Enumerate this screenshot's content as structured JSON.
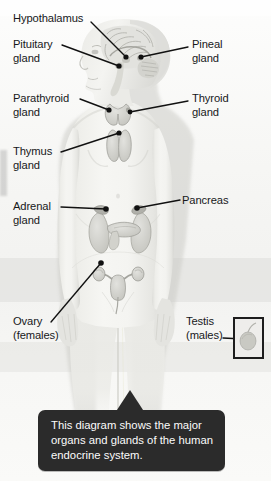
{
  "diagram": {
    "caption": "This diagram shows the major\norgans and glands of the human\nendocrine system.",
    "caption_box_color": "#2b2b2b",
    "caption_text_color": "#fbfbfb",
    "background_color": "#f7f7f5",
    "leader_line_color": "#111111",
    "label_text_color": "#17181a"
  },
  "labels": {
    "hypothalamus": "Hypothalamus",
    "pituitary": "Pituitary\ngland",
    "pineal": "Pineal\ngland",
    "parathyroid": "Parathyroid\ngland",
    "thyroid": "Thyroid\ngland",
    "thymus": "Thymus\ngland",
    "adrenal": "Adrenal\ngland",
    "pancreas": "Pancreas",
    "ovary": "Ovary\n(females)",
    "testis": "Testis\n(males)"
  },
  "organs": [
    {
      "name": "hypothalamus",
      "label": "Hypothalamus",
      "side": "left",
      "region": "brain"
    },
    {
      "name": "pituitary-gland",
      "label": "Pituitary gland",
      "side": "left",
      "region": "brain"
    },
    {
      "name": "pineal-gland",
      "label": "Pineal gland",
      "side": "right",
      "region": "brain"
    },
    {
      "name": "parathyroid-gland",
      "label": "Parathyroid gland",
      "side": "left",
      "region": "neck"
    },
    {
      "name": "thyroid-gland",
      "label": "Thyroid gland",
      "side": "right",
      "region": "neck"
    },
    {
      "name": "thymus-gland",
      "label": "Thymus gland",
      "side": "left",
      "region": "chest"
    },
    {
      "name": "adrenal-gland",
      "label": "Adrenal gland",
      "side": "left",
      "region": "abdomen"
    },
    {
      "name": "pancreas",
      "label": "Pancreas",
      "side": "right",
      "region": "abdomen"
    },
    {
      "name": "ovary",
      "label": "Ovary (females)",
      "side": "left",
      "region": "pelvis"
    },
    {
      "name": "testis",
      "label": "Testis (males)",
      "side": "right",
      "region": "inset-box"
    }
  ]
}
